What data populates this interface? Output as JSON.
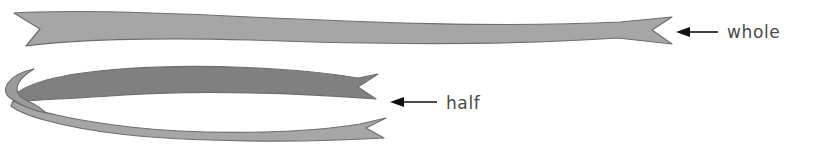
{
  "figure": {
    "title": "Ribbon fraction illustration: whole ribbon and ribbon folded in half",
    "background_color": "#ffffff"
  },
  "colors": {
    "ribbon_light": "#a6a6a6",
    "ribbon_dark": "#808080",
    "ribbon_outline": "#6e6e6e",
    "label_text": "#4a4a4a",
    "arrow": "#111111"
  },
  "annotations": [
    {
      "id": "whole",
      "label": "whole",
      "arrow_direction": "left",
      "label_x": 727,
      "label_y": 38,
      "arrow_tip_x": 676,
      "arrow_tail_x": 718,
      "arrow_y": 32
    },
    {
      "id": "half",
      "label": "half",
      "arrow_direction": "left",
      "label_x": 446,
      "label_y": 109,
      "arrow_tip_x": 390,
      "arrow_tail_x": 437,
      "arrow_y": 102
    }
  ],
  "shapes": {
    "whole_ribbon": {
      "name": "whole-ribbon",
      "fill": "#a6a6a6",
      "stroke": "#6e6e6e",
      "description": "Single long ribbon with swallowtail notched ends, spanning nearly the full width"
    },
    "half_ribbon_upper": {
      "name": "half-ribbon-upper-strip",
      "fill": "#808080",
      "stroke": "#6e6e6e",
      "description": "Darker upper strip of the ribbon folded in half, swallowtail tail at right"
    },
    "half_ribbon_lower": {
      "name": "half-ribbon-lower-strip",
      "fill": "#a6a6a6",
      "stroke": "#6e6e6e",
      "description": "Lighter lower strip of the ribbon folded in half, swallowtail tail at right"
    },
    "half_ribbon_fold": {
      "name": "half-ribbon-fold-loop",
      "fill": "#9b9b9b",
      "stroke": "#6e6e6e",
      "description": "Rounded fold loop at the left end joining the two strips"
    }
  }
}
